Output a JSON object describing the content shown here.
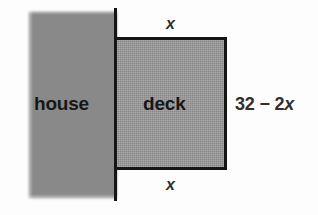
{
  "figure": {
    "type": "geometry-diagram",
    "background_color": "#fdfdfd",
    "house": {
      "label": "house",
      "fill_color": "#8b8b8b"
    },
    "wall": {
      "color": "#151515"
    },
    "deck": {
      "label": "deck",
      "fill_color": "#9b9b9b",
      "border_color": "#151515"
    },
    "dimensions": {
      "top_label": "x",
      "bottom_label": "x",
      "side_label_prefix": "32 − 2",
      "side_label_variable": "x"
    }
  }
}
